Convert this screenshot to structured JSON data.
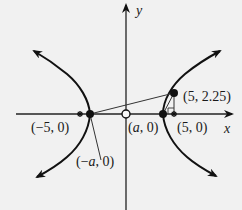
{
  "figure": {
    "type": "hyperbola-diagram",
    "axes": {
      "x_label": "x",
      "y_label": "y"
    },
    "points": [
      {
        "id": "neg5",
        "label": "(−5, 0)",
        "marker": "asterisk"
      },
      {
        "id": "neg_a",
        "label_prefix": "(−",
        "label_var": "a",
        "label_suffix": ", 0)",
        "marker": "filled-dot"
      },
      {
        "id": "origin",
        "label": "",
        "marker": "open-circle"
      },
      {
        "id": "pos_a",
        "label_prefix": "(",
        "label_var": "a",
        "label_suffix": ", 0)",
        "marker": "filled-dot"
      },
      {
        "id": "pos5",
        "label": "(5, 0)",
        "marker": "asterisk"
      },
      {
        "id": "p",
        "label": "(5, 2.25)",
        "marker": "filled-dot"
      }
    ],
    "colors": {
      "background": "#f1f1f1",
      "ink": "#111111",
      "thin_line": "#333333"
    }
  }
}
